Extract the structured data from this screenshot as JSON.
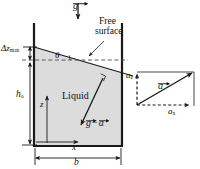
{
  "figure": {
    "type": "diagram",
    "background_color": "#ffffff",
    "line_color": "#1a1a1a",
    "liquid_fill_color": "#d9d9d9",
    "dashed_color": "#555555"
  },
  "labels": {
    "gravity_vector": "g",
    "free_surface_line1": "Free",
    "free_surface_line2": "surface",
    "angle": "θ",
    "delta_z_symbol": "Δz",
    "delta_z_subscript": "max",
    "liquid": "Liquid",
    "h_symbol": "h",
    "h_subscript": "o",
    "z_axis": "z",
    "x_axis": "x",
    "b_width": "b",
    "g_minus_a_left": "g",
    "g_minus_a_minus": "−",
    "g_minus_a_right": "a",
    "accel_vector": "a",
    "accel_x_symbol": "a",
    "accel_x_subscript": "x",
    "accel_z_symbol": "a",
    "accel_z_subscript": "z"
  },
  "geometry": {
    "tank_left_x": 34,
    "tank_right_x": 122,
    "tank_top_y": 23,
    "tank_bottom_y": 146,
    "surface_left_y": 47,
    "surface_right_y": 73,
    "undisturbed_level_y": 60,
    "delta_z_top_y": 47,
    "delta_z_bottom_y": 60,
    "vector_diagram_origin_x": 137,
    "vector_diagram_origin_y": 105,
    "vector_diagram_tip_x": 190,
    "vector_diagram_tip_y": 74
  }
}
